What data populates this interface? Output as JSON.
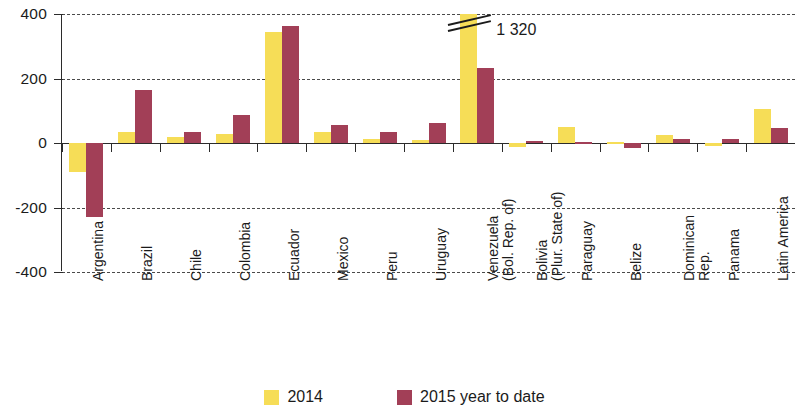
{
  "chart_data": {
    "type": "bar",
    "title": "",
    "xlabel": "",
    "ylabel": "",
    "ylim": [
      -400,
      400
    ],
    "yticks": [
      400,
      200,
      0,
      -200,
      -400
    ],
    "ytick_labels": [
      "400",
      "200",
      "0",
      "-200",
      "-400"
    ],
    "grid": true,
    "legend_position": "bottom",
    "categories": [
      "Argentina",
      "Brazil",
      "Chile",
      "Colombia",
      "Ecuador",
      "Mexico",
      "Peru",
      "Uruguay",
      "Venezuela (Bol. Rep. of)",
      "Bolivia (Plur. State of)",
      "Paraguay",
      "Belize",
      "Dominican Rep.",
      "Panama",
      "Latin America"
    ],
    "category_lines": [
      [
        "Argentina"
      ],
      [
        "Brazil"
      ],
      [
        "Chile"
      ],
      [
        "Colombia"
      ],
      [
        "Ecuador"
      ],
      [
        "Mexico"
      ],
      [
        "Peru"
      ],
      [
        "Uruguay"
      ],
      [
        "Venezuela",
        "(Bol. Rep. of)"
      ],
      [
        "Bolivia",
        "(Plur. State of)"
      ],
      [
        "Paraguay"
      ],
      [
        "Belize"
      ],
      [
        "Dominican",
        "Rep."
      ],
      [
        "Panama"
      ],
      [
        "Latin America"
      ]
    ],
    "series": [
      {
        "name": "2014",
        "color": "#f6dd57",
        "values": [
          -90,
          35,
          20,
          27,
          345,
          33,
          12,
          10,
          1320,
          -12,
          50,
          3,
          25,
          -10,
          105
        ]
      },
      {
        "name": "2015 year to date",
        "color": "#a23f57",
        "values": [
          -230,
          165,
          35,
          87,
          362,
          55,
          35,
          62,
          232,
          5,
          4,
          -15,
          12,
          13,
          48
        ]
      }
    ],
    "annotations": [
      {
        "text": "1 320",
        "series": "2014",
        "category": "Venezuela (Bol. Rep. of)",
        "note": "value exceeds axis maximum; bar clipped with break marks"
      }
    ]
  },
  "legend": {
    "items": [
      {
        "label": "2014",
        "color": "#f6dd57"
      },
      {
        "label": "2015 year to date",
        "color": "#a23f57"
      }
    ]
  }
}
